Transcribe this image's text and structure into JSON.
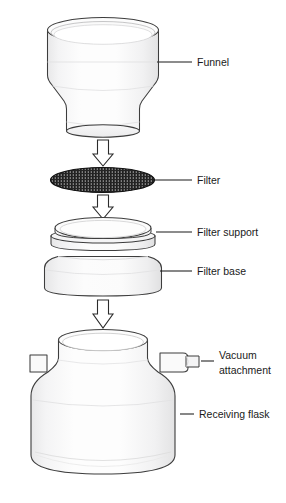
{
  "diagram": {
    "background_color": "#ffffff",
    "line_color": "#3d3d3d",
    "label_color": "#1a1a1a",
    "glass_fill": "#fbfbfb",
    "glass_shade": "#ececed",
    "filter_mesh_color": "#1b1b1b",
    "labels": [
      {
        "id": "funnel",
        "text": "Funnel"
      },
      {
        "id": "filter",
        "text": "Filter"
      },
      {
        "id": "filter-support",
        "text": "Filter support"
      },
      {
        "id": "filter-base",
        "text": "Filter base"
      },
      {
        "id": "vacuum-attachment-line1",
        "text": "Vacuum"
      },
      {
        "id": "vacuum-attachment-line2",
        "text": "attachment"
      },
      {
        "id": "receiving-flask",
        "text": "Receiving flask"
      }
    ],
    "parts": [
      {
        "id": "funnel",
        "name": "Funnel"
      },
      {
        "id": "filter",
        "name": "Filter"
      },
      {
        "id": "filter-support",
        "name": "Filter support"
      },
      {
        "id": "filter-base",
        "name": "Filter base"
      },
      {
        "id": "vacuum-attachment",
        "name": "Vacuum attachment"
      },
      {
        "id": "receiving-flask",
        "name": "Receiving flask"
      }
    ],
    "assembly_arrows": 3
  }
}
